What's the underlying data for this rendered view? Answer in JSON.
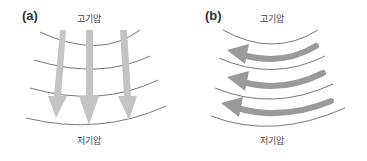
{
  "panels": [
    {
      "label": "(a)",
      "top_label": "고기압",
      "bottom_label": "저기압",
      "arrow_direction": "down"
    },
    {
      "label": "(b)",
      "top_label": "고기압",
      "bottom_label": "저기압",
      "arrow_direction": "left"
    }
  ],
  "colors": {
    "arrow_a": "#c4c4c4",
    "arrow_b": "#9a9a9a",
    "isobar": "#555555"
  }
}
